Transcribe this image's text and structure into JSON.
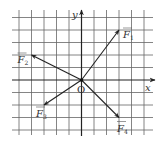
{
  "figure": {
    "type": "vector-diagram",
    "grid": {
      "unit_px": 12.5,
      "x_range": [
        -5,
        5
      ],
      "y_range": [
        -4,
        5
      ],
      "color": "#444444"
    },
    "origin": {
      "label": "O",
      "px": [
        81.5,
        80
      ]
    },
    "axes": {
      "x": {
        "label": "x"
      },
      "y": {
        "label": "y"
      }
    },
    "vectors": [
      {
        "name": "F1",
        "label": "F",
        "subscript": "1",
        "components": [
          3,
          4
        ]
      },
      {
        "name": "F2",
        "label": "F",
        "subscript": "2",
        "components": [
          -4,
          2
        ]
      },
      {
        "name": "F3",
        "label": "F",
        "subscript": "3",
        "components": [
          -3,
          -2
        ]
      },
      {
        "name": "F4",
        "label": "F",
        "subscript": "4",
        "components": [
          3,
          -3
        ]
      }
    ],
    "colors": {
      "line": "#222222",
      "grid": "#555555",
      "text": "#333333"
    }
  }
}
